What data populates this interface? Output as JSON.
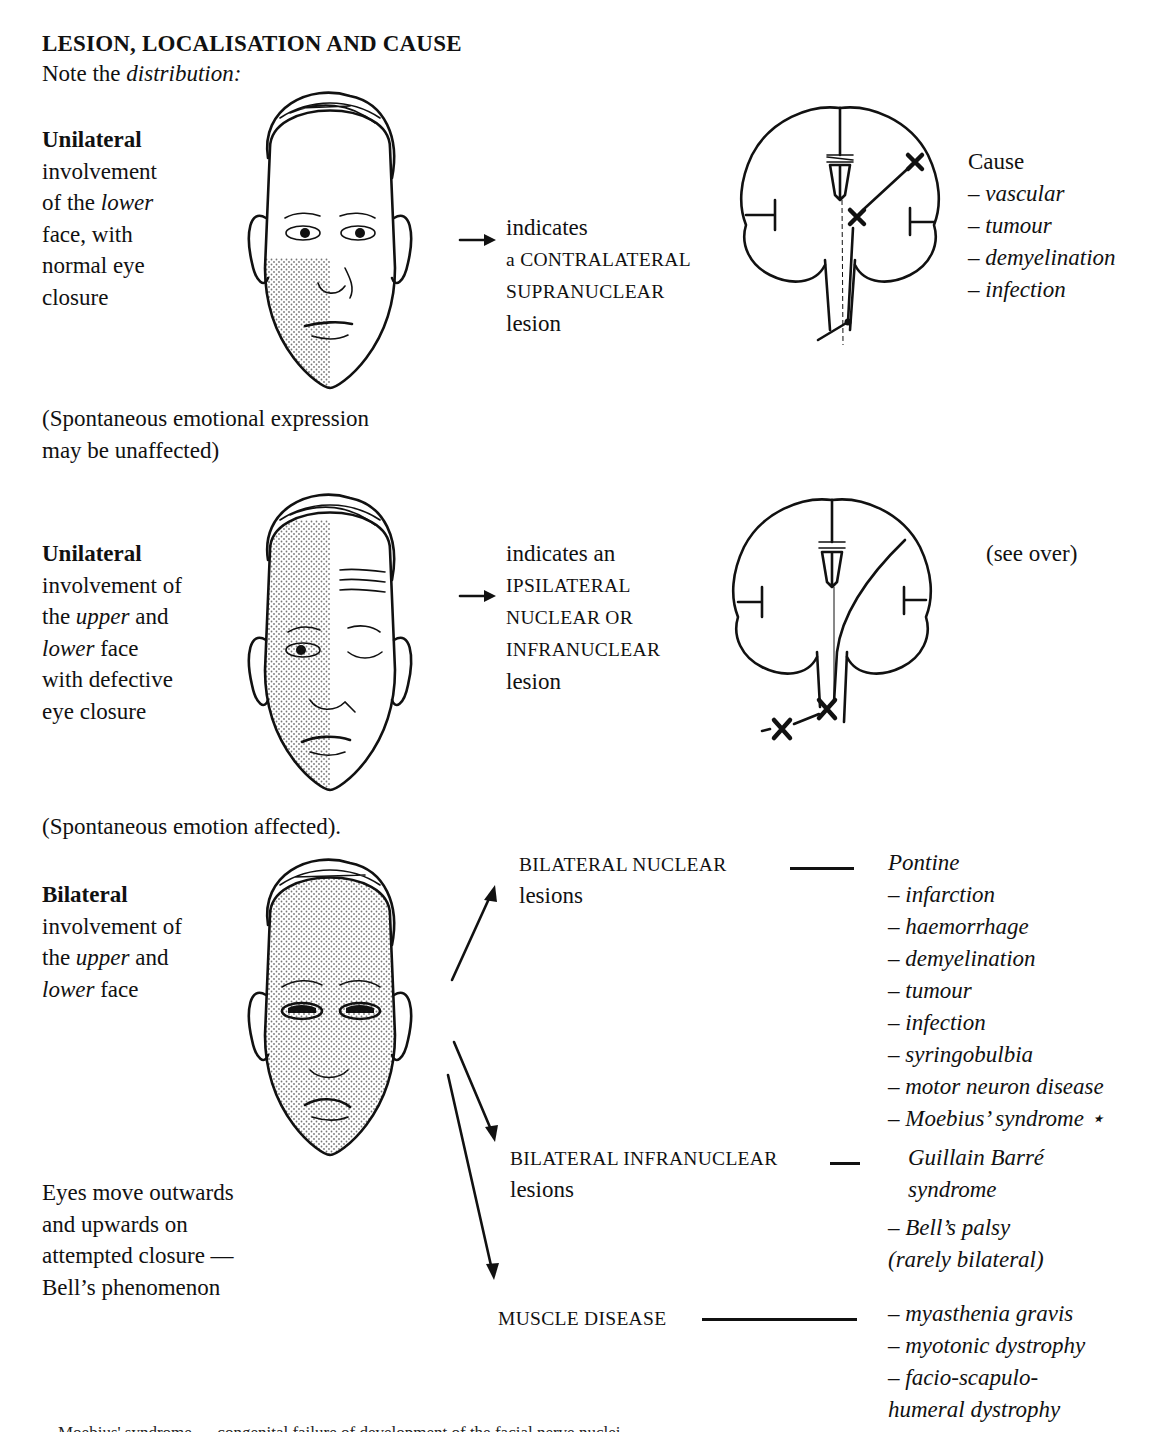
{
  "page": {
    "title": "LESION, LOCALISATION AND CAUSE",
    "subtitle_prefix": "Note the ",
    "subtitle_emph": "distribution:"
  },
  "section1": {
    "heading": "Unilateral",
    "desc": [
      "involvement",
      "of the ",
      "lower",
      "face, with",
      "normal eye",
      "closure"
    ],
    "note": [
      "(Spontaneous emotional expression",
      "may be unaffected)"
    ],
    "indicates": [
      "indicates",
      "a CONTRALATERAL",
      "SUPRANUCLEAR",
      "lesion"
    ],
    "cause_heading": "Cause",
    "causes": [
      "– vascular",
      "– tumour",
      "– demyelination",
      "– infection"
    ],
    "face_shading": "lower-left quadrant"
  },
  "section2": {
    "heading": "Unilateral",
    "desc": [
      "involvement of",
      "the ",
      "upper",
      " and",
      "lower",
      " face",
      "with defective",
      "eye closure"
    ],
    "note": "(Spontaneous emotion affected).",
    "indicates": [
      "indicates an",
      "IPSILATERAL",
      "NUCLEAR OR",
      "INFRANUCLEAR",
      "lesion"
    ],
    "see_over": "(see over)",
    "face_shading": "entire left half"
  },
  "section3": {
    "heading": "Bilateral",
    "desc": [
      "involvement of",
      "the ",
      "upper",
      " and",
      "lower",
      " face"
    ],
    "note": [
      "Eyes move outwards",
      "and upwards on",
      "attempted closure —",
      "Bell’s phenomenon"
    ],
    "branches": [
      {
        "label": [
          "BILATERAL NUCLEAR",
          "lesions"
        ],
        "causes_heading": "Pontine",
        "causes": [
          "– infarction",
          "– haemorrhage",
          "– demyelination",
          "– tumour",
          "– infection",
          "– syringobulbia",
          "– motor neuron disease",
          "– Moebius’ syndrome ⋆"
        ]
      },
      {
        "label": [
          "BILATERAL INFRANUCLEAR",
          "lesions"
        ],
        "causes": [
          "Guillain Barré",
          "syndrome",
          "– Bell’s palsy",
          "(rarely bilateral)"
        ]
      },
      {
        "label": [
          "MUSCLE DISEASE"
        ],
        "causes": [
          "– myasthenia gravis",
          "– myotonic dystrophy",
          "– facio-scapulo-",
          "humeral dystrophy"
        ]
      }
    ],
    "face_shading": "whole face"
  },
  "footer": {
    "text": "Moebius' syndrome — congenital failure of development of the facial nerve nuclei"
  }
}
